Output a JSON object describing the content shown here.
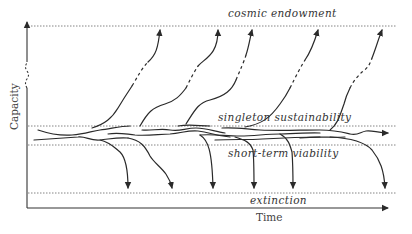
{
  "diagram": {
    "axes": {
      "x_label": "Time",
      "y_label": "Capacity"
    },
    "levels": {
      "cosmic_endowment": "cosmic endowment",
      "singleton_sustainability": "singleton sustainability",
      "short_term_viability": "short-term viability",
      "extinction": "extinction"
    },
    "colors": {
      "line": "#2a2a2a",
      "reference": "#666666",
      "text": "#333333"
    }
  }
}
